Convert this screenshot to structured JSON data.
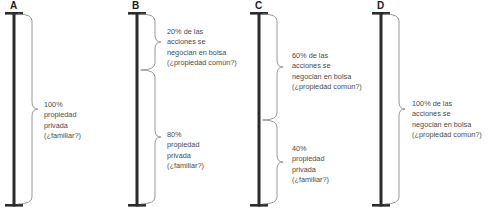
{
  "figure": {
    "width": 492,
    "height": 216,
    "bar_color": "#2b2b2b",
    "bracket_color": "#8c8c8c",
    "text_color": "#4a4a4a",
    "label_color": "#1c1c1c",
    "background": "#ffffff"
  },
  "columns": [
    {
      "label": "A",
      "label_x": 10,
      "bar_center": 14,
      "segments": [
        {
          "name": "full-private",
          "top": 14,
          "bottom": 204,
          "text_x": 44,
          "text_y": 100,
          "lines": [
            "100%",
            "propiedad",
            "privada",
            "(¿familiar?)"
          ]
        }
      ]
    },
    {
      "label": "B",
      "label_x": 132,
      "bar_center": 137,
      "segments": [
        {
          "name": "public-20",
          "top": 14,
          "bottom": 70,
          "text_x": 167,
          "text_y": 27,
          "lines": [
            "20% de las",
            "acciones se",
            "negocian en bolsa",
            "(¿propiedad común?)"
          ]
        },
        {
          "name": "private-80",
          "top": 70,
          "bottom": 204,
          "text_x": 167,
          "text_y": 130,
          "lines": [
            "80%",
            "propiedad",
            "privada",
            "(¿familiar?)"
          ]
        }
      ]
    },
    {
      "label": "C",
      "label_x": 255,
      "bar_center": 259,
      "segments": [
        {
          "name": "public-60",
          "top": 14,
          "bottom": 120,
          "text_x": 292,
          "text_y": 51,
          "lines": [
            "60% de las",
            "acciones se",
            "negocian en bolsa",
            "(¿propiedad común?)"
          ]
        },
        {
          "name": "private-40",
          "top": 120,
          "bottom": 204,
          "text_x": 292,
          "text_y": 144,
          "lines": [
            "40%",
            "propiedad",
            "privada",
            "(¿familiar?)"
          ]
        }
      ]
    },
    {
      "label": "D",
      "label_x": 377,
      "bar_center": 381,
      "segments": [
        {
          "name": "public-100",
          "top": 14,
          "bottom": 204,
          "text_x": 412,
          "text_y": 99,
          "lines": [
            "100% de las",
            "acciones se",
            "negocian en bolsa",
            "(¿propiedad común?)"
          ]
        }
      ]
    }
  ],
  "chart_data": {
    "type": "bar",
    "title": "",
    "xlabel": "",
    "ylabel": "",
    "ylim": [
      0,
      100
    ],
    "categories": [
      "A",
      "B",
      "C",
      "D"
    ],
    "series": [
      {
        "name": "acciones se negocian en bolsa (¿propiedad común?)",
        "values": [
          0,
          20,
          60,
          100
        ]
      },
      {
        "name": "propiedad privada (¿familiar?)",
        "values": [
          100,
          80,
          40,
          0
        ]
      }
    ],
    "annotations": [
      "100% propiedad privada (¿familiar?)",
      "20% de las acciones se negocian en bolsa (¿propiedad común?)",
      "80% propiedad privada (¿familiar?)",
      "60% de las acciones se negocian en bolsa (¿propiedad común?)",
      "40% propiedad privada (¿familiar?)",
      "100% de las acciones se negocian en bolsa (¿propiedad común?)"
    ],
    "grid": false,
    "legend": "none"
  }
}
